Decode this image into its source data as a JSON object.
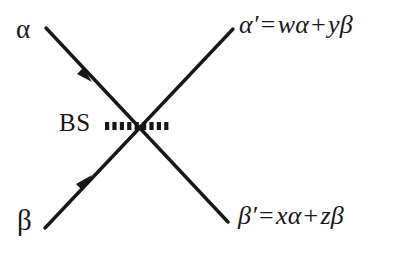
{
  "figure": {
    "type": "beam-splitter-diagram",
    "background_color": "#ffffff",
    "ink_color": "#171717",
    "labels": {
      "input_alpha": "α",
      "input_beta": "β",
      "beam_splitter": "BS",
      "output_alpha_prime": "α′",
      "output_beta_prime": "β′",
      "equals": "=",
      "plus": "+"
    },
    "equations": {
      "alpha_out": {
        "lhs": "α′",
        "term1_coefficient": "w",
        "term1_mode": "α",
        "term2_coefficient": "y",
        "term2_mode": "β",
        "full": "α′ = wα + yβ"
      },
      "beta_out": {
        "lhs": "β′",
        "term1_coefficient": "x",
        "term1_mode": "α",
        "term2_coefficient": "z",
        "term2_mode": "β",
        "full": "β′ = xα + zβ"
      }
    },
    "elements": {
      "beam_splitter_surface": "horizontal dashed line through crossing point",
      "ray_alpha": "incoming ray from upper-left with arrowhead pointing down-right",
      "ray_beta": "incoming ray from lower-left with arrowhead pointing up-right",
      "ray_alpha_prime": "outgoing ray to upper-right",
      "ray_beta_prime": "outgoing ray to lower-right"
    }
  }
}
